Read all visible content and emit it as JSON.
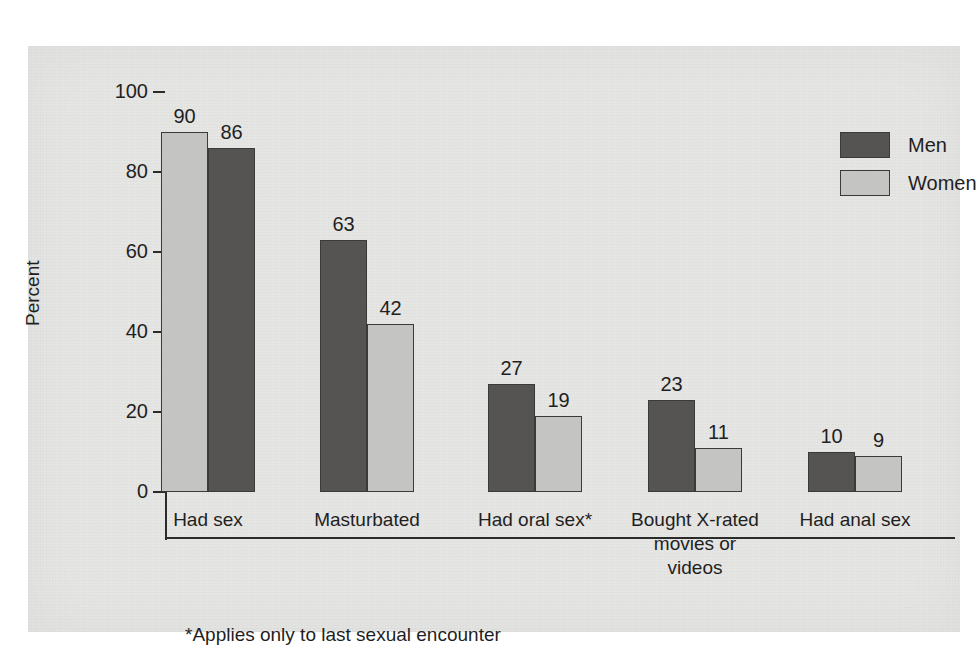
{
  "chart_data": {
    "type": "bar",
    "title": "",
    "xlabel": "",
    "ylabel": "Percent",
    "ylim": [
      0,
      100
    ],
    "yticks": [
      "0",
      "20",
      "40",
      "60",
      "80",
      "100"
    ],
    "grid": false,
    "legend_position": "top-right",
    "categories": [
      "Had sex",
      "Masturbated",
      "Had oral sex*",
      "Bought X-rated\nmovies or\nvideos",
      "Had anal sex"
    ],
    "series": [
      {
        "name": "Men",
        "values": [
          86,
          63,
          27,
          23,
          10
        ],
        "color": "#555452"
      },
      {
        "name": "Women",
        "values": [
          90,
          42,
          19,
          11,
          9
        ],
        "color": "#c4c4c2"
      }
    ],
    "annotations": [
      "*Applies only to last sexual encounter"
    ]
  },
  "axis": {
    "y_label": "Percent",
    "y_ticks": [
      {
        "label": "100",
        "value": 100
      },
      {
        "label": "80",
        "value": 80
      },
      {
        "label": "60",
        "value": 60
      },
      {
        "label": "40",
        "value": 40
      },
      {
        "label": "20",
        "value": 20
      },
      {
        "label": "0",
        "value": 0
      }
    ]
  },
  "legend": {
    "items": [
      {
        "label": "Men",
        "color": "#555452"
      },
      {
        "label": "Women",
        "color": "#c4c4c2"
      }
    ]
  },
  "groups": [
    {
      "label": "Had sex",
      "bars": [
        {
          "series": "Women",
          "value": 90,
          "value_label": "90"
        },
        {
          "series": "Men",
          "value": 86,
          "value_label": "86"
        }
      ]
    },
    {
      "label": "Masturbated",
      "bars": [
        {
          "series": "Men",
          "value": 63,
          "value_label": "63"
        },
        {
          "series": "Women",
          "value": 42,
          "value_label": "42"
        }
      ]
    },
    {
      "label": "Had oral sex*",
      "bars": [
        {
          "series": "Men",
          "value": 27,
          "value_label": "27"
        },
        {
          "series": "Women",
          "value": 19,
          "value_label": "19"
        }
      ]
    },
    {
      "label": "Bought X-rated\nmovies or\nvideos",
      "bars": [
        {
          "series": "Men",
          "value": 23,
          "value_label": "23"
        },
        {
          "series": "Women",
          "value": 11,
          "value_label": "11"
        }
      ]
    },
    {
      "label": "Had anal sex",
      "bars": [
        {
          "series": "Men",
          "value": 10,
          "value_label": "10"
        },
        {
          "series": "Women",
          "value": 9,
          "value_label": "9"
        }
      ]
    }
  ],
  "footnote": "*Applies only to last sexual encounter",
  "colors": {
    "men": "#555452",
    "women": "#c4c4c2",
    "panel": "#e6e6e4",
    "ink": "#1f1f1f",
    "axis": "#2b2b2b"
  }
}
